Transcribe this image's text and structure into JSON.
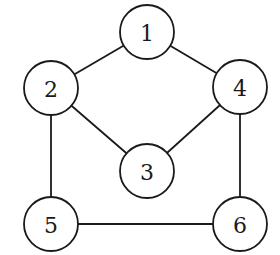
{
  "diagram": {
    "type": "undirected-graph",
    "colors": {
      "stroke": "#1a1a1a",
      "fill": "#ffffff",
      "background": "#ffffff"
    },
    "node_radius": 27,
    "nodes": [
      {
        "id": "1",
        "label": "1",
        "x": 147,
        "y": 32
      },
      {
        "id": "2",
        "label": "2",
        "x": 51,
        "y": 88
      },
      {
        "id": "3",
        "label": "3",
        "x": 147,
        "y": 171
      },
      {
        "id": "4",
        "label": "4",
        "x": 240,
        "y": 87
      },
      {
        "id": "5",
        "label": "5",
        "x": 51,
        "y": 224
      },
      {
        "id": "6",
        "label": "6",
        "x": 240,
        "y": 224
      }
    ],
    "edges": [
      {
        "from": "1",
        "to": "2"
      },
      {
        "from": "1",
        "to": "4"
      },
      {
        "from": "2",
        "to": "3"
      },
      {
        "from": "4",
        "to": "3"
      },
      {
        "from": "2",
        "to": "5"
      },
      {
        "from": "4",
        "to": "6"
      },
      {
        "from": "5",
        "to": "6"
      }
    ]
  }
}
